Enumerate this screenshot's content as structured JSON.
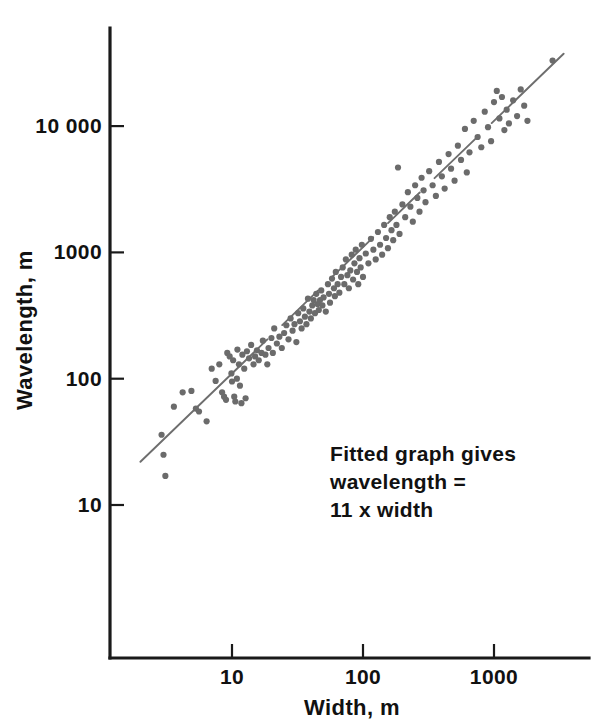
{
  "figure": {
    "background_color": "#ffffff",
    "ink_color": "#111111",
    "point_color": "#6b6b6b",
    "fit_line_color": "#6e6e6e"
  },
  "annotation": {
    "lines": [
      "Fitted graph gives",
      "wavelength =",
      "11 x width"
    ],
    "line1": "Fitted graph gives",
    "line2": "wavelength =",
    "line3": "11 x width"
  },
  "chart_data": {
    "type": "scatter",
    "title": "",
    "xlabel": "Width, m",
    "ylabel": "Wavelength, m",
    "xscale": "log",
    "yscale": "log",
    "grid": false,
    "legend": null,
    "xlim": [
      2.0,
      4000.0
    ],
    "ylim": [
      9.0,
      60000.0
    ],
    "xticks": [
      10,
      100,
      1000
    ],
    "xtick_labels": [
      "10",
      "100",
      "1000"
    ],
    "yticks": [
      10,
      100,
      1000,
      10000
    ],
    "ytick_labels": [
      "10",
      "100",
      "1000",
      "10 000"
    ],
    "fit": {
      "label": "wavelength = 11 x width",
      "slope": 1.0,
      "multiplier": 11,
      "x_start": 2.0,
      "x_end": 3400.0,
      "style": "dashed-thin"
    },
    "points": [
      [
        2.9,
        36
      ],
      [
        3.0,
        25
      ],
      [
        3.1,
        17
      ],
      [
        3.6,
        60
      ],
      [
        4.2,
        78
      ],
      [
        4.9,
        80
      ],
      [
        5.3,
        58
      ],
      [
        5.6,
        55
      ],
      [
        6.4,
        46
      ],
      [
        7.0,
        120
      ],
      [
        7.5,
        96
      ],
      [
        8.0,
        130
      ],
      [
        8.4,
        78
      ],
      [
        8.7,
        72
      ],
      [
        9.0,
        68
      ],
      [
        9.2,
        160
      ],
      [
        9.6,
        150
      ],
      [
        9.9,
        110
      ],
      [
        10.0,
        95
      ],
      [
        10.2,
        140
      ],
      [
        10.4,
        72
      ],
      [
        10.6,
        66
      ],
      [
        10.9,
        100
      ],
      [
        11.0,
        170
      ],
      [
        11.3,
        130
      ],
      [
        11.5,
        88
      ],
      [
        11.8,
        64
      ],
      [
        12.0,
        155
      ],
      [
        12.4,
        120
      ],
      [
        12.7,
        70
      ],
      [
        13.0,
        165
      ],
      [
        13.5,
        145
      ],
      [
        14.0,
        185
      ],
      [
        14.6,
        130
      ],
      [
        15.0,
        150
      ],
      [
        15.5,
        168
      ],
      [
        16.0,
        140
      ],
      [
        16.8,
        160
      ],
      [
        17.2,
        200
      ],
      [
        18.0,
        155
      ],
      [
        18.6,
        130
      ],
      [
        19.0,
        175
      ],
      [
        20.0,
        210
      ],
      [
        20.5,
        160
      ],
      [
        21.0,
        250
      ],
      [
        22.0,
        190
      ],
      [
        23.0,
        215
      ],
      [
        24.0,
        175
      ],
      [
        25.0,
        230
      ],
      [
        26.0,
        265
      ],
      [
        27.0,
        205
      ],
      [
        28.0,
        300
      ],
      [
        29.0,
        240
      ],
      [
        30.0,
        270
      ],
      [
        31.0,
        195
      ],
      [
        32.0,
        330
      ],
      [
        33.0,
        285
      ],
      [
        34.0,
        250
      ],
      [
        35.0,
        360
      ],
      [
        36.0,
        310
      ],
      [
        37.0,
        270
      ],
      [
        38.0,
        430
      ],
      [
        39.0,
        340
      ],
      [
        40.0,
        300
      ],
      [
        41.0,
        380
      ],
      [
        42.0,
        420
      ],
      [
        43.0,
        330
      ],
      [
        44.0,
        470
      ],
      [
        45.0,
        390
      ],
      [
        46.0,
        350
      ],
      [
        47.0,
        420
      ],
      [
        48.0,
        500
      ],
      [
        49.0,
        380
      ],
      [
        50.0,
        440
      ],
      [
        52.0,
        340
      ],
      [
        54.0,
        560
      ],
      [
        55.0,
        470
      ],
      [
        56.0,
        400
      ],
      [
        58.0,
        620
      ],
      [
        60.0,
        520
      ],
      [
        61.0,
        450
      ],
      [
        62.0,
        700
      ],
      [
        64.0,
        560
      ],
      [
        66.0,
        480
      ],
      [
        68.0,
        640
      ],
      [
        70.0,
        760
      ],
      [
        72.0,
        560
      ],
      [
        74.0,
        880
      ],
      [
        76.0,
        660
      ],
      [
        78.0,
        520
      ],
      [
        80.0,
        720
      ],
      [
        82.0,
        960
      ],
      [
        84.0,
        610
      ],
      [
        86.0,
        820
      ],
      [
        88.0,
        1050
      ],
      [
        90.0,
        700
      ],
      [
        92.0,
        560
      ],
      [
        94.0,
        900
      ],
      [
        96.0,
        760
      ],
      [
        98.0,
        1150
      ],
      [
        100.0,
        640
      ],
      [
        105.0,
        980
      ],
      [
        110.0,
        820
      ],
      [
        115.0,
        1280
      ],
      [
        120.0,
        1050
      ],
      [
        125.0,
        880
      ],
      [
        130.0,
        1450
      ],
      [
        135.0,
        1150
      ],
      [
        140.0,
        960
      ],
      [
        145.0,
        1650
      ],
      [
        150.0,
        1300
      ],
      [
        155.0,
        1080
      ],
      [
        160.0,
        1900
      ],
      [
        165.0,
        1500
      ],
      [
        170.0,
        1250
      ],
      [
        175.0,
        2100
      ],
      [
        180.0,
        1650
      ],
      [
        185.0,
        4700
      ],
      [
        190.0,
        1400
      ],
      [
        200.0,
        2400
      ],
      [
        210.0,
        1900
      ],
      [
        220.0,
        3000
      ],
      [
        230.0,
        2300
      ],
      [
        240.0,
        1750
      ],
      [
        250.0,
        3400
      ],
      [
        260.0,
        2700
      ],
      [
        270.0,
        2100
      ],
      [
        280.0,
        3900
      ],
      [
        290.0,
        3100
      ],
      [
        300.0,
        2500
      ],
      [
        320.0,
        4400
      ],
      [
        340.0,
        3400
      ],
      [
        360.0,
        2800
      ],
      [
        380.0,
        5200
      ],
      [
        400.0,
        4000
      ],
      [
        420.0,
        3200
      ],
      [
        450.0,
        6000
      ],
      [
        470.0,
        4600
      ],
      [
        500.0,
        3700
      ],
      [
        530.0,
        7000
      ],
      [
        560.0,
        5400
      ],
      [
        600.0,
        9500
      ],
      [
        620.0,
        4300
      ],
      [
        650.0,
        6200
      ],
      [
        700.0,
        11000
      ],
      [
        750.0,
        8200
      ],
      [
        800.0,
        6800
      ],
      [
        850.0,
        13000
      ],
      [
        900.0,
        9800
      ],
      [
        950.0,
        7600
      ],
      [
        1000.0,
        15500
      ],
      [
        1050.0,
        19000
      ],
      [
        1100.0,
        11500
      ],
      [
        1150.0,
        17000
      ],
      [
        1200.0,
        9300
      ],
      [
        1250.0,
        13500
      ],
      [
        1300.0,
        10500
      ],
      [
        1400.0,
        16000
      ],
      [
        1500.0,
        12000
      ],
      [
        1600.0,
        19500
      ],
      [
        1700.0,
        14500
      ],
      [
        1800.0,
        11000
      ],
      [
        2800.0,
        33000
      ]
    ]
  }
}
